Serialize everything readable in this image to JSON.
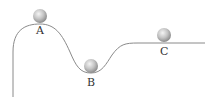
{
  "diagram": {
    "type": "equilibrium-stability",
    "colors": {
      "curve": "#8a8a8a",
      "ball_light": "#f2f2f2",
      "ball_dark": "#8c8c8c",
      "label": "#333333",
      "background": "#ffffff"
    },
    "balls": [
      {
        "id": "A",
        "label": "A",
        "position": "hilltop"
      },
      {
        "id": "B",
        "label": "B",
        "position": "valley"
      },
      {
        "id": "C",
        "label": "C",
        "position": "flat"
      }
    ]
  }
}
